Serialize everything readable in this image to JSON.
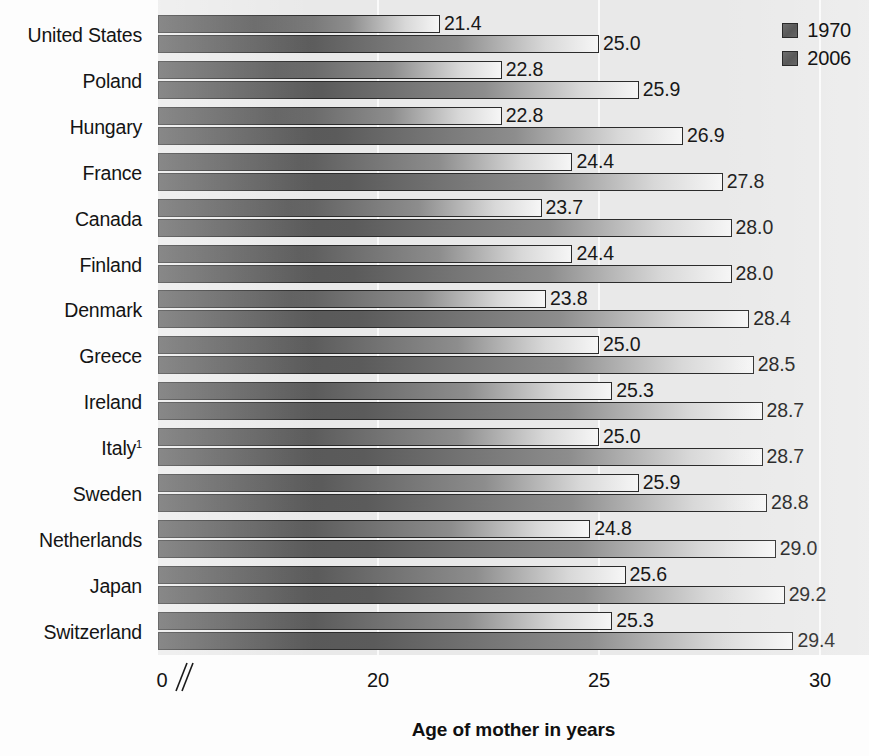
{
  "chart_data": {
    "type": "bar",
    "title": "",
    "xlabel": "Age of mother in years",
    "ylabel": "",
    "orientation": "horizontal",
    "grid": true,
    "legend_position": "top-right",
    "axis_break_after": 0,
    "xlim": [
      0,
      31
    ],
    "xticks": [
      "0",
      "20",
      "25",
      "30"
    ],
    "xtick_values": [
      0,
      20,
      25,
      30
    ],
    "categories": [
      "United States",
      "Poland",
      "Hungary",
      "France",
      "Canada",
      "Finland",
      "Denmark",
      "Greece",
      "Ireland",
      "Italy",
      "Sweden",
      "Netherlands",
      "Japan",
      "Switzerland"
    ],
    "category_footnotes": [
      "",
      "",
      "",
      "",
      "",
      "",
      "",
      "",
      "",
      "1",
      "",
      "",
      "",
      ""
    ],
    "series": [
      {
        "name": "1970",
        "values": [
          21.4,
          22.8,
          22.8,
          24.4,
          23.7,
          24.4,
          23.8,
          25.0,
          25.3,
          25.0,
          25.9,
          24.8,
          25.6,
          25.3
        ],
        "labels": [
          "21.4",
          "22.8",
          "22.8",
          "24.4",
          "23.7",
          "24.4",
          "23.8",
          "25.0",
          "25.3",
          "25.0",
          "25.9",
          "24.8",
          "25.6",
          "25.3"
        ]
      },
      {
        "name": "2006",
        "values": [
          25.0,
          25.9,
          26.9,
          27.8,
          28.0,
          28.0,
          28.4,
          28.5,
          28.7,
          28.7,
          28.8,
          29.0,
          29.2,
          29.4
        ],
        "labels": [
          "25.0",
          "25.9",
          "26.9",
          "27.8",
          "28.0",
          "28.0",
          "28.4",
          "28.5",
          "28.7",
          "28.7",
          "28.8",
          "29.0",
          "29.2",
          "29.4"
        ]
      }
    ]
  },
  "legend": {
    "items": [
      {
        "label": "1970"
      },
      {
        "label": "2006"
      }
    ]
  },
  "axis": {
    "title": "Age of mother in years",
    "ticks": [
      "0",
      "20",
      "25",
      "30"
    ]
  },
  "colors": {
    "bar_gradient_start": "#555555",
    "bar_gradient_end": "#f6f6f6",
    "bar_border": "#2b2b2b",
    "plot_background": "#e9e9e9",
    "gridline": "#fafafa",
    "text": "#141414"
  }
}
